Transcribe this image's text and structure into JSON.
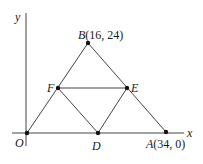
{
  "figure": {
    "type": "geometry-diagram",
    "axes": {
      "x_label": "x",
      "y_label": "y",
      "origin_label": "O"
    },
    "points": {
      "O": {
        "name": "O",
        "coord_text": ""
      },
      "A": {
        "name": "A",
        "coord_text": "(34, 0)"
      },
      "B": {
        "name": "B",
        "coord_text": "(16, 24)"
      },
      "D": {
        "name": "D",
        "coord_text": ""
      },
      "E": {
        "name": "E",
        "coord_text": ""
      },
      "F": {
        "name": "F",
        "coord_text": ""
      }
    },
    "segments": [
      "OB",
      "BA",
      "FE",
      "FD",
      "DE"
    ],
    "colors": {
      "line": "#3a3a3a",
      "point": "#111111",
      "text": "#1a1a1a"
    }
  }
}
